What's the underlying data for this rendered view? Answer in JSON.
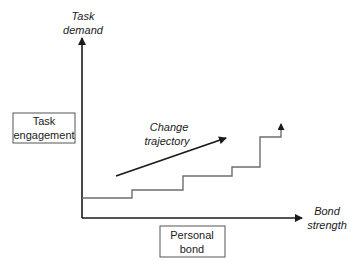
{
  "diagram": {
    "y_axis": {
      "label_line1": "Task",
      "label_line2": "demand"
    },
    "x_axis": {
      "label_line1": "Bond",
      "label_line2": "strength"
    },
    "left_box": {
      "line1": "Task",
      "line2": "engagement"
    },
    "bottom_box": {
      "line1": "Personal",
      "line2": "bond"
    },
    "trajectory": {
      "line1": "Change",
      "line2": "trajectory"
    },
    "colors": {
      "axis": "#1a1a1a",
      "steps": "#6e6e6e",
      "box_border": "#555555"
    }
  }
}
